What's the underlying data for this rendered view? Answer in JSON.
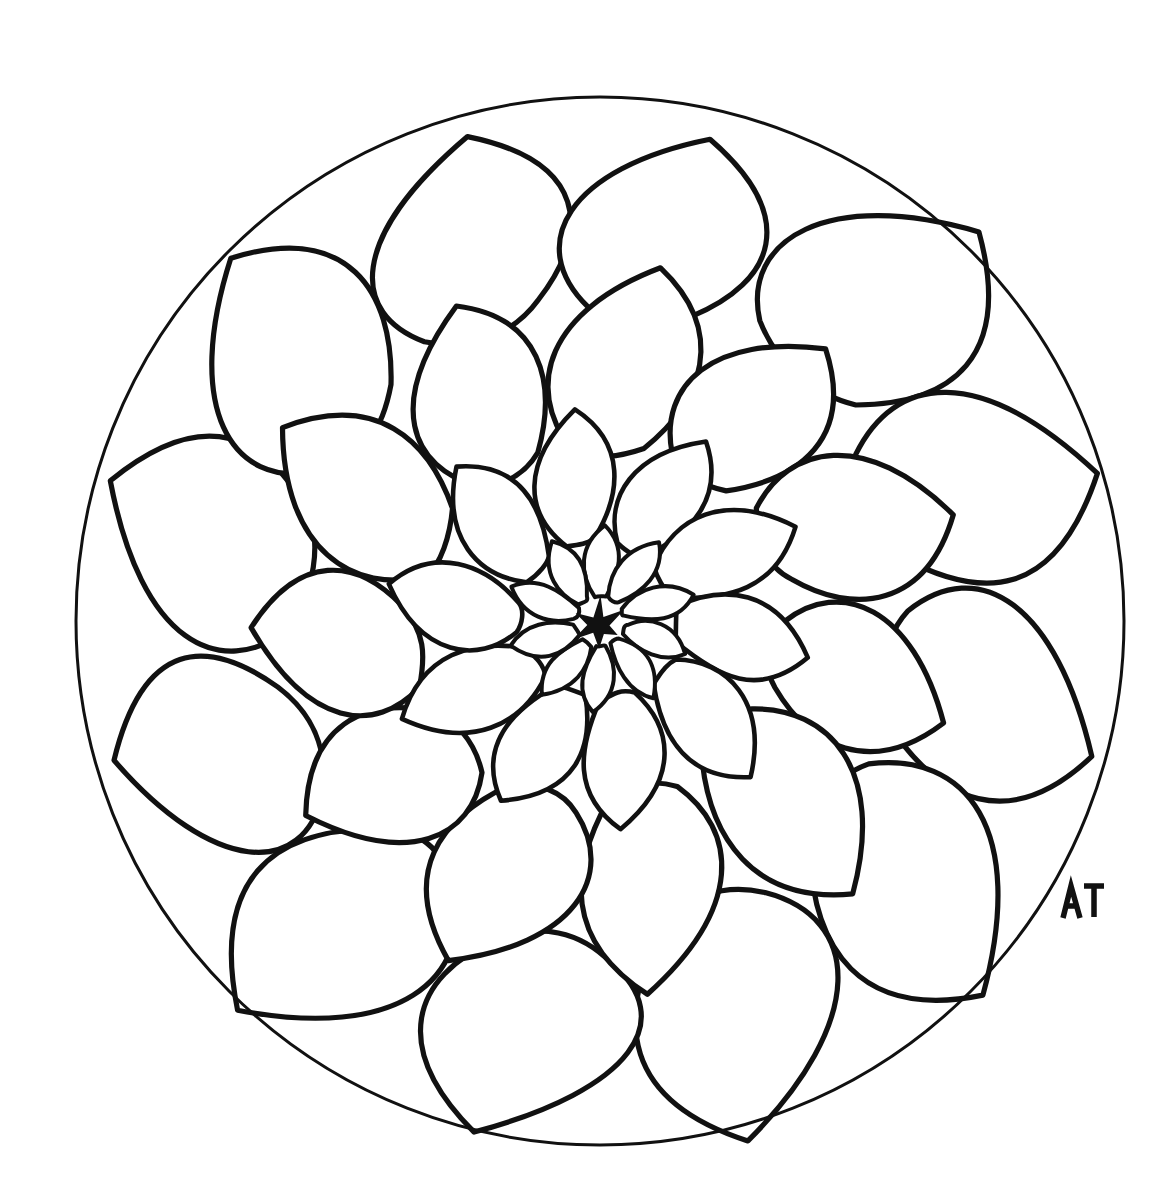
{
  "artwork": {
    "title": "Mandala Flower Coloring Page",
    "subject": "dahlia-style layered flower inside a circle",
    "style": "hand-drawn black ink line art, uncolored",
    "background_color": "#ffffff",
    "line_color": "#111111",
    "signature": "AT"
  },
  "canvas": {
    "width": 1171,
    "height": 1203
  },
  "circle": {
    "cx": 600,
    "cy": 621,
    "r": 524,
    "stroke_width": 3
  },
  "center_star": {
    "cx": 598,
    "cy": 625,
    "radius": 26,
    "points": 6,
    "color": "#111111"
  },
  "rings": [
    {
      "name": "ring-core-rosette",
      "petal_count": 10,
      "inner_radius": 26,
      "outer_radius": 95
    },
    {
      "name": "ring-inner",
      "petal_count": 10,
      "inner_radius": 80,
      "outer_radius": 215
    },
    {
      "name": "ring-middle",
      "petal_count": 11,
      "inner_radius": 185,
      "outer_radius": 360
    },
    {
      "name": "ring-outer",
      "petal_count": 12,
      "inner_radius": 320,
      "outer_radius": 520
    }
  ],
  "signature_mark": {
    "label": "AT",
    "x": 1062,
    "y": 884,
    "width": 42,
    "height": 34
  }
}
